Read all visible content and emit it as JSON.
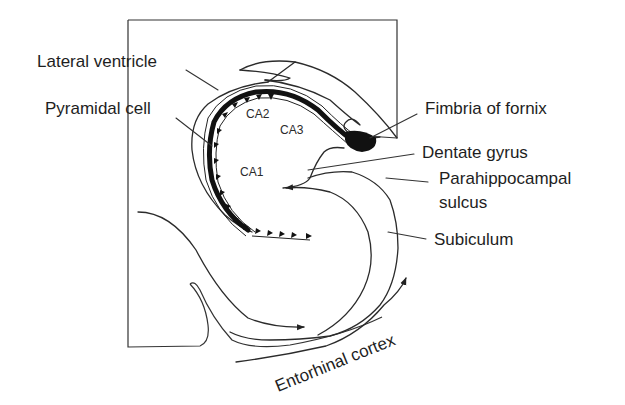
{
  "figure": {
    "type": "anatomical diagram"
  },
  "labels": {
    "lateral_ventricle": "Lateral ventricle",
    "pyramidal_cell": "Pyramidal cell",
    "fimbria_of_fornix": "Fimbria of fornix",
    "dentate_gyrus": "Dentate gyrus",
    "parahippocampal_sulcus_line1": "Parahippocampal",
    "parahippocampal_sulcus_line2": "sulcus",
    "subiculum": "Subiculum",
    "entorhinal_cortex": "Entorhinal cortex"
  },
  "regions": {
    "ca1": "CA1",
    "ca2": "CA2",
    "ca3": "CA3"
  },
  "colors": {
    "line": "#2b2b2b",
    "text": "#1e1e1e",
    "background": "#ffffff"
  }
}
